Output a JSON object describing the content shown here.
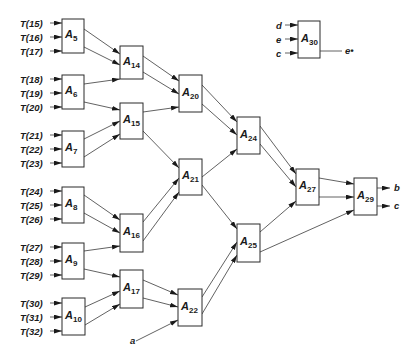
{
  "diagram": {
    "type": "network",
    "blocks": [
      {
        "id": "A5",
        "name": "A",
        "sub": "5",
        "x": 62,
        "y": 19,
        "w": 22,
        "h": 34
      },
      {
        "id": "A6",
        "name": "A",
        "sub": "6",
        "x": 62,
        "y": 75,
        "w": 22,
        "h": 34
      },
      {
        "id": "A7",
        "name": "A",
        "sub": "7",
        "x": 62,
        "y": 131,
        "w": 22,
        "h": 36
      },
      {
        "id": "A8",
        "name": "A",
        "sub": "8",
        "x": 62,
        "y": 187,
        "w": 22,
        "h": 36
      },
      {
        "id": "A9",
        "name": "A",
        "sub": "9",
        "x": 62,
        "y": 243,
        "w": 22,
        "h": 36
      },
      {
        "id": "A10",
        "name": "A",
        "sub": "10",
        "x": 62,
        "y": 298,
        "w": 23,
        "h": 37
      },
      {
        "id": "A14",
        "name": "A",
        "sub": "14",
        "x": 120,
        "y": 46,
        "w": 23,
        "h": 33
      },
      {
        "id": "A15",
        "name": "A",
        "sub": "15",
        "x": 120,
        "y": 103,
        "w": 23,
        "h": 36
      },
      {
        "id": "A16",
        "name": "A",
        "sub": "16",
        "x": 120,
        "y": 214,
        "w": 23,
        "h": 38
      },
      {
        "id": "A17",
        "name": "A",
        "sub": "17",
        "x": 120,
        "y": 270,
        "w": 23,
        "h": 38
      },
      {
        "id": "A20",
        "name": "A",
        "sub": "20",
        "x": 179,
        "y": 75,
        "w": 23,
        "h": 37
      },
      {
        "id": "A21",
        "name": "A",
        "sub": "21",
        "x": 179,
        "y": 159,
        "w": 23,
        "h": 36
      },
      {
        "id": "A22",
        "name": "A",
        "sub": "22",
        "x": 178,
        "y": 289,
        "w": 24,
        "h": 37
      },
      {
        "id": "A24",
        "name": "A",
        "sub": "24",
        "x": 237,
        "y": 117,
        "w": 23,
        "h": 37
      },
      {
        "id": "A25",
        "name": "A",
        "sub": "25",
        "x": 237,
        "y": 224,
        "w": 23,
        "h": 38
      },
      {
        "id": "A27",
        "name": "A",
        "sub": "27",
        "x": 296,
        "y": 169,
        "w": 23,
        "h": 36
      },
      {
        "id": "A29",
        "name": "A",
        "sub": "29",
        "x": 354,
        "y": 178,
        "w": 23,
        "h": 37
      },
      {
        "id": "A30",
        "name": "A",
        "sub": "30",
        "x": 298,
        "y": 21,
        "w": 22,
        "h": 37
      }
    ],
    "inputs": [
      {
        "label": "T(15)",
        "x": 20,
        "y": 23,
        "to": "A5"
      },
      {
        "label": "T(16)",
        "x": 20,
        "y": 37,
        "to": "A5"
      },
      {
        "label": "T(17)",
        "x": 20,
        "y": 51,
        "to": "A5"
      },
      {
        "label": "T(18)",
        "x": 20,
        "y": 79,
        "to": "A6"
      },
      {
        "label": "T(19)",
        "x": 20,
        "y": 93,
        "to": "A6"
      },
      {
        "label": "T(20)",
        "x": 20,
        "y": 107,
        "to": "A6"
      },
      {
        "label": "T(21)",
        "x": 20,
        "y": 135,
        "to": "A7"
      },
      {
        "label": "T(22)",
        "x": 20,
        "y": 149,
        "to": "A7"
      },
      {
        "label": "T(23)",
        "x": 20,
        "y": 163,
        "to": "A7"
      },
      {
        "label": "T(24)",
        "x": 20,
        "y": 191,
        "to": "A8"
      },
      {
        "label": "T(25)",
        "x": 20,
        "y": 205,
        "to": "A8"
      },
      {
        "label": "T(26)",
        "x": 20,
        "y": 219,
        "to": "A8"
      },
      {
        "label": "T(27)",
        "x": 20,
        "y": 247,
        "to": "A9"
      },
      {
        "label": "T(28)",
        "x": 20,
        "y": 261,
        "to": "A9"
      },
      {
        "label": "T(29)",
        "x": 20,
        "y": 275,
        "to": "A9"
      },
      {
        "label": "T(30)",
        "x": 20,
        "y": 303,
        "to": "A10"
      },
      {
        "label": "T(31)",
        "x": 20,
        "y": 317,
        "to": "A10"
      },
      {
        "label": "T(32)",
        "x": 20,
        "y": 331,
        "to": "A10"
      },
      {
        "label": "d",
        "x": 276,
        "y": 25,
        "to": "A30"
      },
      {
        "label": "e",
        "x": 276,
        "y": 39,
        "to": "A30"
      },
      {
        "label": "c",
        "x": 276,
        "y": 53,
        "to": "A30"
      }
    ],
    "edges": [
      {
        "x1": 84,
        "y1": 29,
        "x2": 120,
        "y2": 54
      },
      {
        "x1": 84,
        "y1": 47,
        "x2": 120,
        "y2": 65
      },
      {
        "x1": 84,
        "y1": 84,
        "x2": 120,
        "y2": 79
      },
      {
        "x1": 84,
        "y1": 102,
        "x2": 120,
        "y2": 110
      },
      {
        "x1": 84,
        "y1": 139,
        "x2": 120,
        "y2": 121
      },
      {
        "x1": 84,
        "y1": 157,
        "x2": 120,
        "y2": 134
      },
      {
        "x1": 143,
        "y1": 56,
        "x2": 179,
        "y2": 81
      },
      {
        "x1": 143,
        "y1": 72,
        "x2": 179,
        "y2": 94
      },
      {
        "x1": 143,
        "y1": 112,
        "x2": 179,
        "y2": 107
      },
      {
        "x1": 143,
        "y1": 131,
        "x2": 179,
        "y2": 168
      },
      {
        "x1": 84,
        "y1": 195,
        "x2": 120,
        "y2": 220
      },
      {
        "x1": 84,
        "y1": 213,
        "x2": 120,
        "y2": 233
      },
      {
        "x1": 84,
        "y1": 251,
        "x2": 120,
        "y2": 246
      },
      {
        "x1": 84,
        "y1": 269,
        "x2": 120,
        "y2": 277
      },
      {
        "x1": 85,
        "y1": 307,
        "x2": 120,
        "y2": 291
      },
      {
        "x1": 85,
        "y1": 325,
        "x2": 120,
        "y2": 304
      },
      {
        "x1": 143,
        "y1": 222,
        "x2": 179,
        "y2": 178
      },
      {
        "x1": 143,
        "y1": 241,
        "x2": 179,
        "y2": 192
      },
      {
        "x1": 143,
        "y1": 280,
        "x2": 178,
        "y2": 295
      },
      {
        "x1": 143,
        "y1": 298,
        "x2": 178,
        "y2": 307
      },
      {
        "x1": 136,
        "y1": 341,
        "x2": 178,
        "y2": 320
      },
      {
        "x1": 202,
        "y1": 85,
        "x2": 237,
        "y2": 122
      },
      {
        "x1": 202,
        "y1": 104,
        "x2": 237,
        "y2": 135
      },
      {
        "x1": 202,
        "y1": 177,
        "x2": 237,
        "y2": 149
      },
      {
        "x1": 202,
        "y1": 185,
        "x2": 237,
        "y2": 229
      },
      {
        "x1": 202,
        "y1": 297,
        "x2": 237,
        "y2": 242
      },
      {
        "x1": 202,
        "y1": 314,
        "x2": 237,
        "y2": 255
      },
      {
        "x1": 260,
        "y1": 126,
        "x2": 296,
        "y2": 174
      },
      {
        "x1": 260,
        "y1": 144,
        "x2": 296,
        "y2": 187
      },
      {
        "x1": 260,
        "y1": 232,
        "x2": 296,
        "y2": 201
      },
      {
        "x1": 260,
        "y1": 252,
        "x2": 354,
        "y2": 210
      },
      {
        "x1": 319,
        "y1": 178,
        "x2": 354,
        "y2": 184
      },
      {
        "x1": 319,
        "y1": 197,
        "x2": 354,
        "y2": 197
      }
    ],
    "outputs": [
      {
        "label": "b",
        "x1": 377,
        "y1": 188,
        "x2": 390,
        "y2": 188,
        "tx": 394,
        "ty": 191
      },
      {
        "label": "c",
        "x1": 377,
        "y1": 206,
        "x2": 390,
        "y2": 206,
        "tx": 394,
        "ty": 209
      }
    ],
    "a_input": {
      "label": "a",
      "x": 130,
      "y": 344
    },
    "e_output": {
      "label": "e•",
      "x1": 320,
      "y1": 51,
      "x2": 342,
      "y2": 51,
      "tx": 345,
      "ty": 54
    }
  }
}
